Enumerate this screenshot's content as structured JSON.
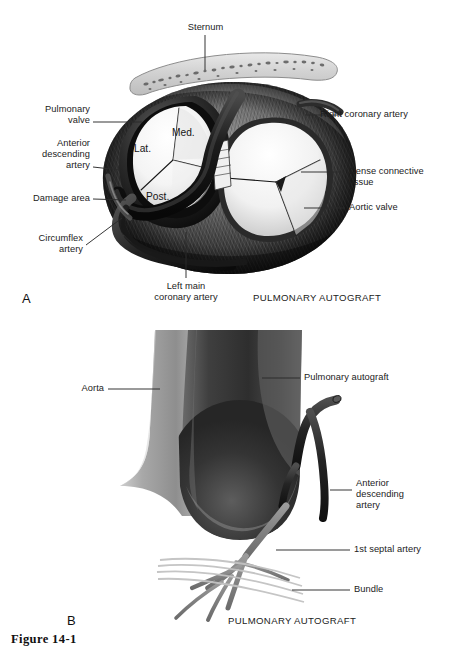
{
  "figure": {
    "caption": "Figure 14-1",
    "panels": [
      {
        "letter": "A",
        "subtitle": "PULMONARY AUTOGRAFT",
        "view": "operative superior view of pulmonary autograft and aortic root",
        "labels": [
          {
            "name": "sternum",
            "text": "Sternum",
            "align": "center"
          },
          {
            "name": "pulmonary-valve",
            "text": "Pulmonary\nvalve",
            "align": "right"
          },
          {
            "name": "anterior-descending-artery",
            "text": "Anterior\ndescending\nartery",
            "align": "right"
          },
          {
            "name": "damage-area",
            "text": "Damage area",
            "align": "right"
          },
          {
            "name": "circumflex-artery",
            "text": "Circumflex\nartery",
            "align": "right"
          },
          {
            "name": "left-main-coronary-artery",
            "text": "Left main\ncoronary artery",
            "align": "center"
          },
          {
            "name": "right-coronary-artery",
            "text": "Right coronary artery",
            "align": "left"
          },
          {
            "name": "dense-connective-tissue",
            "text": "Dense connective\ntissue",
            "align": "left"
          },
          {
            "name": "aortic-valve",
            "text": "Aortic valve",
            "align": "left"
          }
        ],
        "cusps": [
          {
            "name": "lateral-cusp",
            "text": "Lat."
          },
          {
            "name": "medial-cusp",
            "text": "Med."
          },
          {
            "name": "posterior-cusp",
            "text": "Post."
          }
        ]
      },
      {
        "letter": "B",
        "subtitle": "PULMONARY AUTOGRAFT",
        "view": "anterior view of harvested pulmonary autograft with coronary arteries",
        "labels": [
          {
            "name": "aorta",
            "text": "Aorta",
            "align": "right"
          },
          {
            "name": "pulmonary-autograft",
            "text": "Pulmonary autograft",
            "align": "left"
          },
          {
            "name": "anterior-descending-artery",
            "text": "Anterior\ndescending\nartery",
            "align": "left"
          },
          {
            "name": "first-septal-artery",
            "text": "1st septal artery",
            "align": "left"
          },
          {
            "name": "bundle",
            "text": "Bundle",
            "align": "left"
          }
        ]
      }
    ]
  },
  "colors": {
    "background": "#ffffff",
    "label_text": "#1b1b1b",
    "leader_line": "#2a2a2a",
    "tissue_dark": "#161616",
    "tissue_mid": "#6e6e6e",
    "tissue_light": "#b9b9b9",
    "valve_cusp": "#f2f2f2",
    "bone_fill": "#d9d9d9",
    "vessel_dark": "#2b2b2b",
    "autograft_dark": "#3c3c3c",
    "aorta_gray": "#9a9a9a"
  }
}
